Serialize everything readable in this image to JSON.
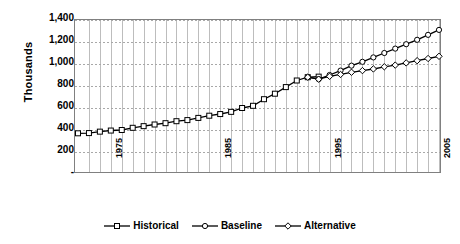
{
  "chart_data": {
    "type": "line",
    "title": "",
    "subtitle": "",
    "xlabel": "",
    "ylabel": "Thousands",
    "xlim": [
      1972,
      2005
    ],
    "ylim": [
      0,
      1400
    ],
    "ytick_labels": [
      "1,400",
      "1,200",
      "1,000",
      "800",
      "600",
      "400",
      "200",
      "-"
    ],
    "ytick_values": [
      1400,
      1200,
      1000,
      800,
      600,
      400,
      200,
      0
    ],
    "xtick_labels": [
      "1975",
      "1985",
      "1995",
      "2005"
    ],
    "xtick_values": [
      1975,
      1985,
      1995,
      2005
    ],
    "grid": "both",
    "legend_position": "bottom",
    "series": [
      {
        "name": "Historical",
        "marker": "square",
        "color": "#000000",
        "x": [
          1972,
          1973,
          1974,
          1975,
          1976,
          1977,
          1978,
          1979,
          1980,
          1981,
          1982,
          1983,
          1984,
          1985,
          1986,
          1987,
          1988,
          1989,
          1990,
          1991,
          1992,
          1993,
          1994
        ],
        "values": [
          370,
          372,
          385,
          395,
          400,
          420,
          435,
          450,
          462,
          480,
          490,
          510,
          530,
          545,
          565,
          600,
          620,
          680,
          730,
          790,
          850,
          880,
          885
        ]
      },
      {
        "name": "Baseline",
        "marker": "circle",
        "color": "#000000",
        "x": [
          1993,
          1994,
          1995,
          1996,
          1997,
          1998,
          1999,
          2000,
          2001,
          2002,
          2003,
          2004,
          2005
        ],
        "values": [
          880,
          862,
          900,
          940,
          985,
          1020,
          1060,
          1100,
          1140,
          1180,
          1220,
          1265,
          1310
        ]
      },
      {
        "name": "Alternative",
        "marker": "diamond",
        "color": "#000000",
        "x": [
          1993,
          1994,
          1995,
          1996,
          1997,
          1998,
          1999,
          2000,
          2001,
          2002,
          2003,
          2004,
          2005
        ],
        "values": [
          880,
          862,
          888,
          905,
          925,
          940,
          955,
          975,
          990,
          1010,
          1030,
          1050,
          1070
        ]
      }
    ]
  },
  "legend": {
    "items": [
      {
        "label": "Historical"
      },
      {
        "label": "Baseline"
      },
      {
        "label": "Alternative"
      }
    ]
  }
}
